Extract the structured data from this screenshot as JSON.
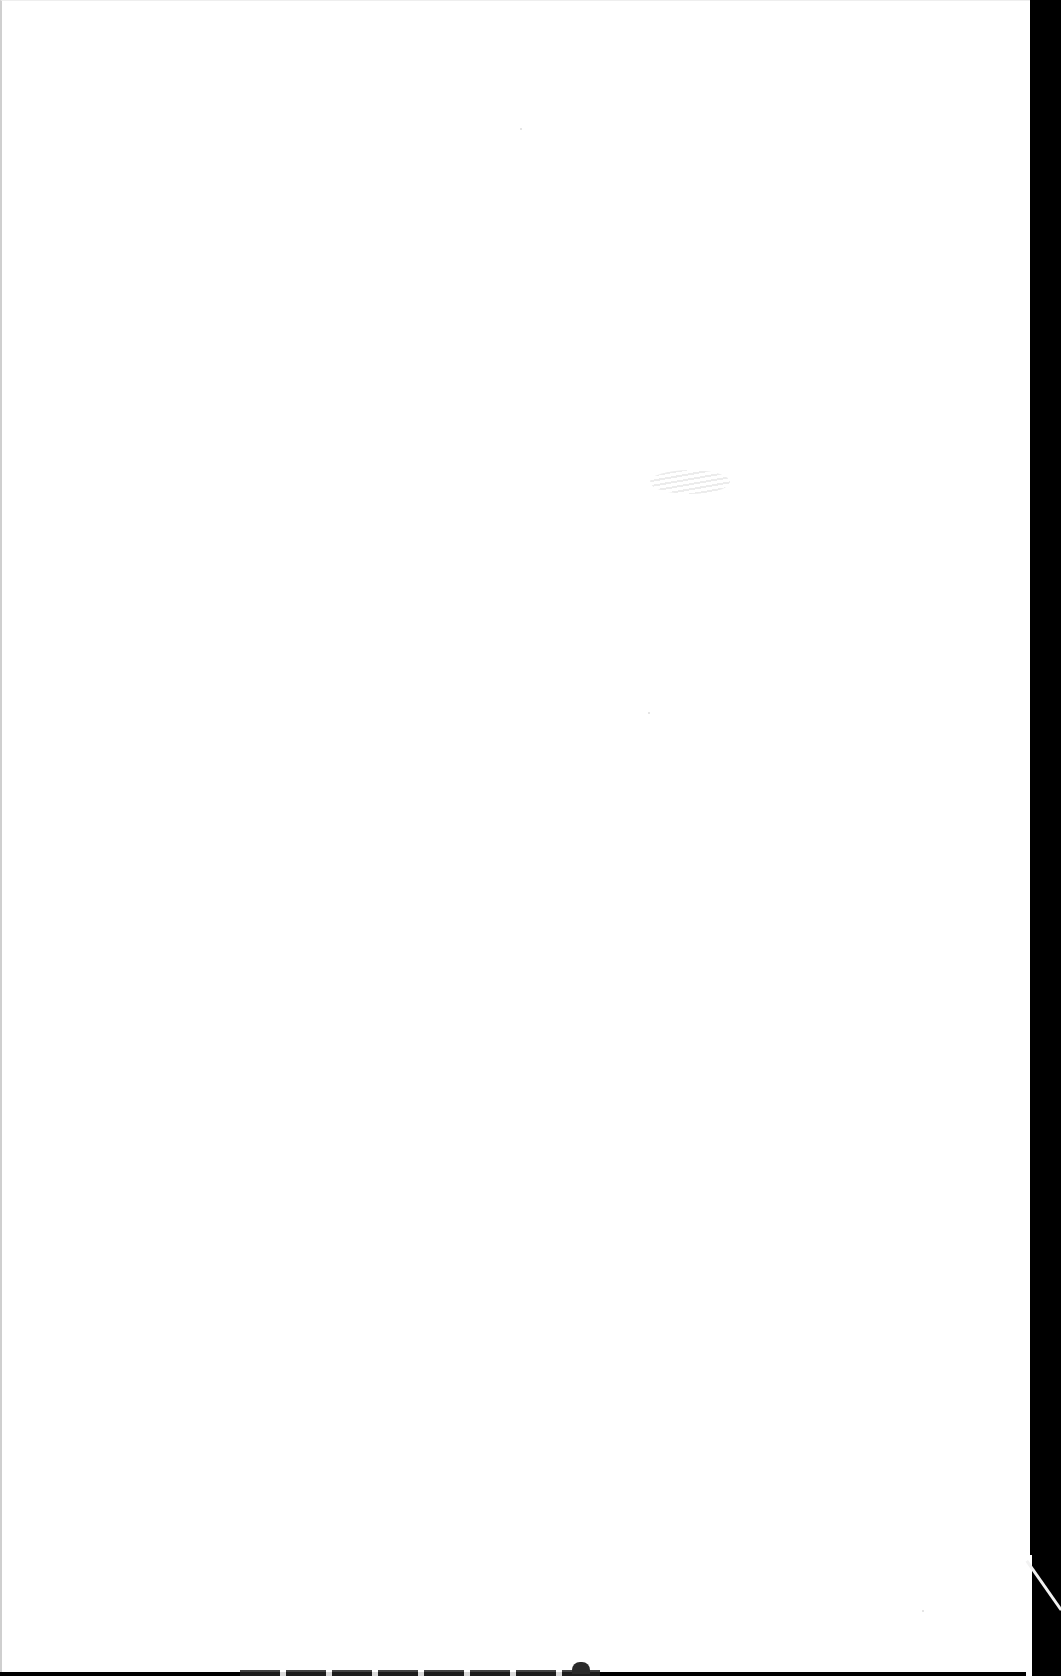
{
  "page": {
    "type": "blank-scanned-page",
    "text_content": "",
    "colors": {
      "paper": "#ffffff",
      "scanner_background": "#000000",
      "smudge": "#969696"
    }
  }
}
